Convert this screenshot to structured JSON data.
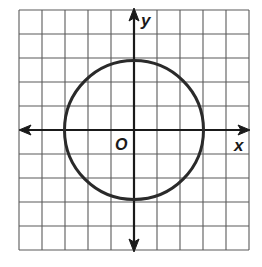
{
  "figure": {
    "type": "coordinate-plane-circle",
    "grid": {
      "columns": 10,
      "rows": 10,
      "line_color": "#5a5a5a"
    },
    "axes": {
      "x_label": "x",
      "y_label": "y",
      "origin_label": "O",
      "color": "#1a1a1a"
    },
    "circle": {
      "center": [
        0,
        0
      ],
      "radius": 3,
      "equation": "x^2 + y^2 = 9",
      "color": "#2a2a2a"
    }
  }
}
